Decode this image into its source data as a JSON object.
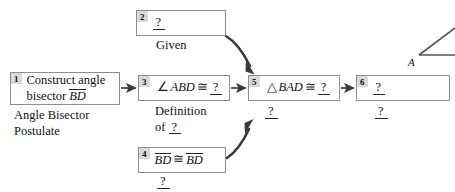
{
  "diagram": {
    "blank_marker": "?",
    "boxes": [
      {
        "id": "box-1",
        "number": "1",
        "line1": "Construct angle",
        "line2_prefix": "bisector ",
        "line2_overline": "BD",
        "x": 10,
        "y": 72,
        "w": 110,
        "h": 33
      },
      {
        "id": "box-2",
        "number": "2",
        "blank": "?",
        "x": 136,
        "y": 10,
        "w": 90,
        "h": 26
      },
      {
        "id": "box-3",
        "number": "3",
        "angle_symbol": "∠",
        "angle_name": "ABD",
        "congruent_symbol": "≅",
        "blank": "?",
        "x": 138,
        "y": 75,
        "w": 92,
        "h": 26
      },
      {
        "id": "box-4",
        "number": "4",
        "left_overline": "BD",
        "congruent_symbol": "≅",
        "right_overline": "BD",
        "x": 138,
        "y": 147,
        "w": 88,
        "h": 26
      },
      {
        "id": "box-5",
        "number": "5",
        "triangle_symbol": "△",
        "triangle_name": "BAD",
        "congruent_symbol": "≅",
        "blank": "?",
        "x": 248,
        "y": 75,
        "w": 92,
        "h": 26
      },
      {
        "id": "box-6",
        "number": "6",
        "blank": "?",
        "x": 356,
        "y": 75,
        "w": 94,
        "h": 26
      }
    ],
    "captions": [
      {
        "id": "caption-box-1",
        "for_box": "1",
        "line1": "Angle Bisector",
        "line2": "Postulate",
        "x": 14,
        "y": 108
      },
      {
        "id": "caption-box-2",
        "for_box": "2",
        "line1": "Given",
        "x": 156,
        "y": 38
      },
      {
        "id": "caption-box-3",
        "for_box": "3",
        "line1": "Definition",
        "line2_prefix": "of ",
        "line2_blank": "?",
        "x": 155,
        "y": 104
      },
      {
        "id": "caption-box-4",
        "for_box": "4",
        "blank": "?",
        "x": 157,
        "y": 174
      },
      {
        "id": "caption-box-5",
        "for_box": "5",
        "blank": "?",
        "x": 265,
        "y": 104
      },
      {
        "id": "caption-box-6",
        "for_box": "6",
        "blank": "?",
        "x": 375,
        "y": 104
      }
    ],
    "arrows": [
      {
        "id": "arrow-1-to-3",
        "type": "straight",
        "from": "box-1",
        "to": "box-3"
      },
      {
        "id": "arrow-3-to-5",
        "type": "straight",
        "from": "box-3",
        "to": "box-5"
      },
      {
        "id": "arrow-5-to-6",
        "type": "straight",
        "from": "box-5",
        "to": "box-6"
      },
      {
        "id": "arrow-2-to-5",
        "type": "curved",
        "from": "box-2",
        "to": "box-5"
      },
      {
        "id": "arrow-4-to-5",
        "type": "curved",
        "from": "box-4",
        "to": "box-5"
      }
    ],
    "figure": {
      "id": "angle-figure",
      "vertex_label": "A",
      "description": "partial angle figure clipped at right edge"
    },
    "colors": {
      "box_border": "#8d8d8d",
      "badge_bg": "#d9d9d9",
      "text": "#111111",
      "arrow": "#3a3a3a",
      "background": "#ffffff"
    }
  }
}
